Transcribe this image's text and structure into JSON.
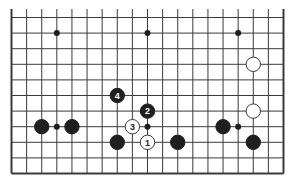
{
  "diagram": {
    "type": "go-board",
    "board_size": 19,
    "visible_rows": 11,
    "edges": {
      "left": true,
      "right": true,
      "bottom": true,
      "top": false
    },
    "colors": {
      "line": "#3a3a3a",
      "black_stone": "#1f1f1f",
      "white_stone": "#ffffff",
      "background": "#ffffff"
    },
    "star_points": [
      {
        "col": 3,
        "row": 9
      },
      {
        "col": 9,
        "row": 9
      },
      {
        "col": 15,
        "row": 9
      },
      {
        "col": 3,
        "row": 3
      },
      {
        "col": 9,
        "row": 3
      },
      {
        "col": 15,
        "row": 3
      }
    ],
    "stones": [
      {
        "color": "black",
        "col": 2,
        "row": 3,
        "label": ""
      },
      {
        "color": "black",
        "col": 4,
        "row": 3,
        "label": ""
      },
      {
        "color": "black",
        "col": 7,
        "row": 2,
        "label": ""
      },
      {
        "color": "black",
        "col": 11,
        "row": 2,
        "label": ""
      },
      {
        "color": "black",
        "col": 14,
        "row": 3,
        "label": ""
      },
      {
        "color": "black",
        "col": 16,
        "row": 2,
        "label": ""
      },
      {
        "color": "white",
        "col": 16,
        "row": 7,
        "label": ""
      },
      {
        "color": "white",
        "col": 16,
        "row": 4,
        "label": ""
      },
      {
        "color": "white",
        "col": 9,
        "row": 2,
        "label": "1"
      },
      {
        "color": "black",
        "col": 9,
        "row": 4,
        "label": "2"
      },
      {
        "color": "white",
        "col": 8,
        "row": 3,
        "label": "3"
      },
      {
        "color": "black",
        "col": 7,
        "row": 5,
        "label": "4"
      }
    ]
  }
}
